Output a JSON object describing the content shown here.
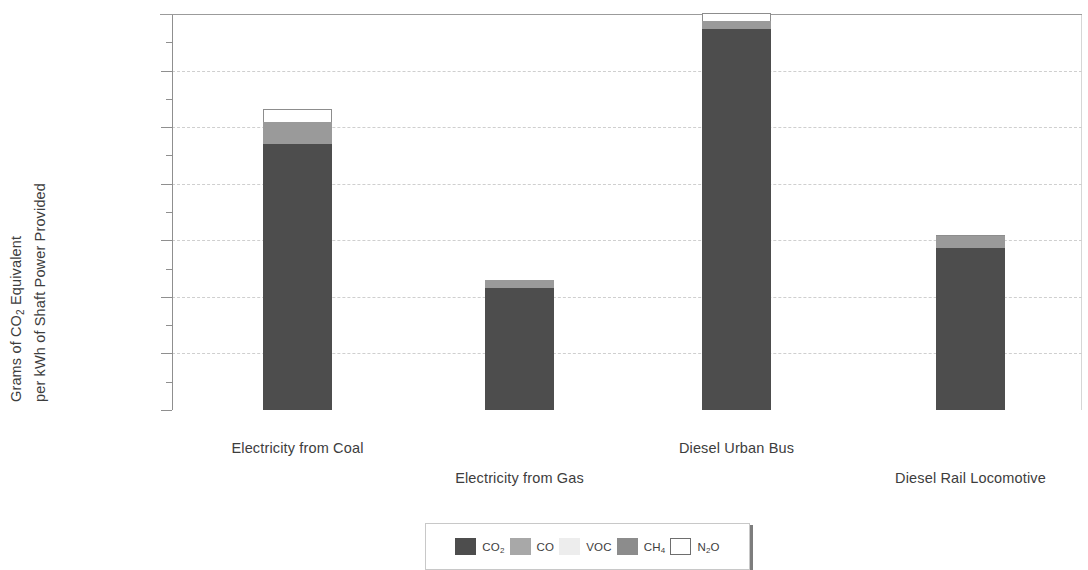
{
  "chart_data": {
    "type": "bar",
    "stacked": true,
    "title": "",
    "xlabel": "",
    "ylabel": "Grams of CO2 Equivalent per kWh of Shaft Power Provided",
    "ylabel_lines": [
      "Grams of CO2 Equivalent",
      "per kWh of Shaft Power Provided"
    ],
    "ylim": [
      0,
      1400
    ],
    "ytick_step": 200,
    "yminor_step": 100,
    "grid": true,
    "gridline_style": "dashed",
    "legend_position": "bottom-center",
    "categories": [
      "Electricity from Coal",
      "Electricity from Gas",
      "Diesel Urban Bus",
      "Diesel Rail Locomotive"
    ],
    "series": [
      {
        "name": "CO2",
        "label": "CO",
        "sub": "2",
        "color": "#4d4d4d",
        "values": [
          942,
          430,
          1346,
          572
        ]
      },
      {
        "name": "CO",
        "label": "CO",
        "sub": "",
        "color": "#9a9a9a",
        "values": [
          78,
          28,
          28,
          43
        ]
      },
      {
        "name": "VOC",
        "label": "VOC",
        "sub": "",
        "color": "#ececec",
        "values": [
          0,
          0,
          0,
          0
        ]
      },
      {
        "name": "CH4",
        "label": "CH",
        "sub": "4",
        "color": "#8a8a8a",
        "values": [
          0,
          0,
          0,
          0
        ]
      },
      {
        "name": "N2O",
        "label": "N",
        "sub": "2",
        "suffix": "O",
        "color": "#ffffff",
        "values": [
          43,
          0,
          29,
          5
        ]
      }
    ],
    "totals": [
      1063,
      458,
      1403,
      620
    ],
    "ytick_labels": [
      "0",
      "200",
      "400",
      "600",
      "800",
      "1 000",
      "1 200",
      "1 400"
    ],
    "ytick_values": [
      0,
      200,
      400,
      600,
      800,
      1000,
      1200,
      1400
    ],
    "yminor_values": [
      100,
      300,
      500,
      700,
      900,
      1100,
      1300
    ]
  },
  "legend": {
    "items": [
      {
        "label": "CO",
        "sub": "2",
        "suffix": "",
        "color": "#4d4d4d",
        "bordered": false
      },
      {
        "label": "CO",
        "sub": "",
        "suffix": "",
        "color": "#a8a8a8",
        "bordered": false
      },
      {
        "label": "VOC",
        "sub": "",
        "suffix": "",
        "color": "#ededed",
        "bordered": false
      },
      {
        "label": "CH",
        "sub": "4",
        "suffix": "",
        "color": "#8c8c8c",
        "bordered": false
      },
      {
        "label": "N",
        "sub": "2",
        "suffix": "O",
        "color": "#ffffff",
        "bordered": true
      }
    ]
  },
  "colors": {
    "axis": "#8f8f8f",
    "grid": "#cfcfcf",
    "text": "#3d3d3d",
    "background": "#ffffff"
  }
}
